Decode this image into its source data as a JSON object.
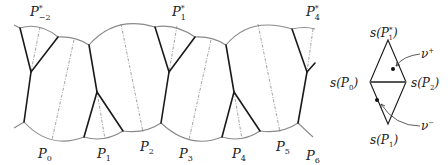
{
  "diagram": {
    "left_labels": {
      "top": [
        {
          "id": "P_-2_star",
          "base": "P",
          "sup": "*",
          "sub": "−2",
          "x": 30,
          "y": 14
        },
        {
          "id": "P_1_star",
          "base": "P",
          "sup": "*",
          "sub": "1",
          "x": 170,
          "y": 14
        },
        {
          "id": "P_4_star",
          "base": "P",
          "sup": "*",
          "sub": "4",
          "x": 305,
          "y": 14
        }
      ],
      "bottom": [
        {
          "id": "P_0",
          "base": "P",
          "sub": "0",
          "x": 38,
          "y": 158
        },
        {
          "id": "P_1",
          "base": "P",
          "sub": "1",
          "x": 97,
          "y": 158
        },
        {
          "id": "P_2",
          "base": "P",
          "sub": "2",
          "x": 143,
          "y": 151
        },
        {
          "id": "P_3",
          "base": "P",
          "sub": "3",
          "x": 179,
          "y": 158
        },
        {
          "id": "P_4",
          "base": "P",
          "sub": "4",
          "x": 232,
          "y": 158
        },
        {
          "id": "P_5",
          "base": "P",
          "sub": "5",
          "x": 276,
          "y": 151
        },
        {
          "id": "P_6",
          "base": "P",
          "sub": "6",
          "x": 306,
          "y": 160
        }
      ]
    },
    "right_labels": {
      "top": {
        "text_pre": "s(",
        "base": "P",
        "sup": "*",
        "sub": "1",
        "text_post": ")",
        "x": 377,
        "y": 37
      },
      "left": {
        "text_pre": "s(",
        "base": "P",
        "sub": "0",
        "text_post": ")",
        "x": 330,
        "y": 89
      },
      "right": {
        "text_pre": "s(",
        "base": "P",
        "sub": "2",
        "text_post": ")",
        "x": 417,
        "y": 89
      },
      "bottom": {
        "text_pre": "s(",
        "base": "P",
        "sub": "1",
        "text_post": ")",
        "x": 377,
        "y": 148
      },
      "nu_plus": {
        "base": "ν",
        "sup": "+",
        "x": 424,
        "y": 57
      },
      "nu_minus": {
        "base": "ν",
        "sup": "−",
        "x": 424,
        "y": 125
      }
    },
    "colors": {
      "boundary_arc": "#8a8a8a",
      "bold_edge": "#1a1a1a",
      "dashed_edge": "#8a8a8a"
    }
  }
}
